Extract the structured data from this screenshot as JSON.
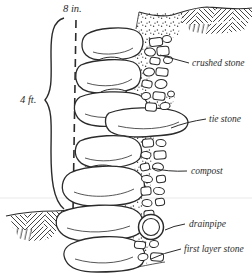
{
  "figure": {
    "ink_color": "#2b2b2b",
    "paper_color": "#ffffff"
  },
  "labels": {
    "top_measurement": "8 in.",
    "height_measurement": "4 ft.",
    "crushed_stone": "crushed stone",
    "tie_stone": "tie stone",
    "compost": "compost",
    "drainpipe": "drainpipe",
    "first_layer_stone": "first layer stone"
  }
}
